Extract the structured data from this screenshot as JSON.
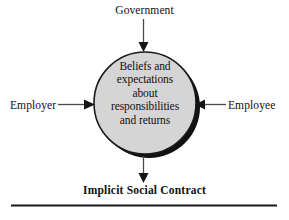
{
  "diagram": {
    "title": "Implicit Social Contract",
    "center_node": {
      "name": "beliefs-and-expectations",
      "lines": [
        "Beliefs and",
        "expectations",
        "about",
        "responsibilities",
        "and returns"
      ],
      "fill_color": "#d5d5d5",
      "stroke_color": "#1a1a1a",
      "shadow_color": "#111111"
    },
    "inputs": {
      "top": {
        "label": "Government",
        "arrow": "down-arrow-icon"
      },
      "left": {
        "label": "Employer",
        "arrow": "right-arrow-icon"
      },
      "right": {
        "label": "Employee",
        "arrow": "left-arrow-icon"
      }
    },
    "output": {
      "label": "Implicit Social Contract",
      "arrow": "down-arrow-icon"
    },
    "rule": {
      "name": "bottom-divider",
      "color": "#1a1a1a"
    }
  }
}
